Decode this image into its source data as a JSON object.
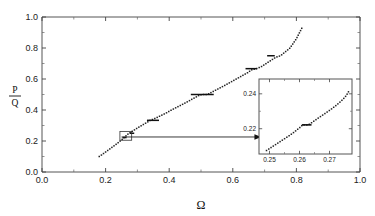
{
  "figure": {
    "background_color": "#ffffff",
    "line_color": "#222222",
    "axis_color": "#444444"
  },
  "chart_data": {
    "type": "line",
    "title": "",
    "subtitle": "",
    "xlabel": "Ω",
    "ylabel_numerator": "P",
    "ylabel_denominator": "Q",
    "ylabel": "P/Q",
    "xlim": [
      0.0,
      1.0
    ],
    "ylim": [
      0.0,
      1.0
    ],
    "grid": false,
    "legend": false,
    "legend_position": "none",
    "xticks": [
      0.0,
      0.2,
      0.4,
      0.6,
      0.8,
      1.0
    ],
    "xticklabels": [
      "0.0",
      "0.2",
      "0.4",
      "0.6",
      "0.8",
      "1.0"
    ],
    "yticks": [
      0.0,
      0.2,
      0.4,
      0.6,
      0.8,
      1.0
    ],
    "yticklabels": [
      "0.0",
      "0.2",
      "0.4",
      "0.6",
      "0.8",
      "1.0"
    ],
    "minor_tick_count_per_interval": 1,
    "x": [
      0.18,
      0.186,
      0.192,
      0.198,
      0.204,
      0.21,
      0.216,
      0.222,
      0.228,
      0.234,
      0.24,
      0.246,
      0.252,
      0.258,
      0.264,
      0.27,
      0.276,
      0.282,
      0.288,
      0.294,
      0.3,
      0.31,
      0.32,
      0.33,
      0.34,
      0.35,
      0.36,
      0.37,
      0.38,
      0.39,
      0.4,
      0.412,
      0.424,
      0.436,
      0.448,
      0.46,
      0.472,
      0.484,
      0.496,
      0.508,
      0.52,
      0.534,
      0.548,
      0.562,
      0.576,
      0.59,
      0.604,
      0.618,
      0.632,
      0.646,
      0.66,
      0.675,
      0.69,
      0.705,
      0.72,
      0.735,
      0.75,
      0.765,
      0.78,
      0.8,
      0.82
    ],
    "y": [
      0.1,
      0.108,
      0.117,
      0.126,
      0.135,
      0.144,
      0.153,
      0.162,
      0.171,
      0.18,
      0.19,
      0.2,
      0.21,
      0.222,
      0.233,
      0.244,
      0.252,
      0.26,
      0.268,
      0.276,
      0.284,
      0.296,
      0.308,
      0.32,
      0.333,
      0.341,
      0.35,
      0.36,
      0.37,
      0.38,
      0.392,
      0.405,
      0.418,
      0.43,
      0.443,
      0.456,
      0.47,
      0.483,
      0.497,
      0.5,
      0.5,
      0.515,
      0.53,
      0.545,
      0.56,
      0.576,
      0.592,
      0.608,
      0.624,
      0.64,
      0.66,
      0.667,
      0.68,
      0.7,
      0.72,
      0.74,
      0.75,
      0.775,
      0.8,
      0.86,
      0.94
    ],
    "plateaus": [
      {
        "ratio": "1/3",
        "y": 0.3333,
        "x_start": 0.33,
        "x_end": 0.368
      },
      {
        "ratio": "1/2",
        "y": 0.5,
        "x_start": 0.468,
        "x_end": 0.54
      },
      {
        "ratio": "2/3",
        "y": 0.6667,
        "x_start": 0.64,
        "x_end": 0.676
      },
      {
        "ratio": "3/4",
        "y": 0.75,
        "x_start": 0.708,
        "x_end": 0.732
      },
      {
        "ratio": "2/9",
        "y": 0.2222,
        "x_start": 0.253,
        "x_end": 0.266
      },
      {
        "ratio": "1/4",
        "y": 0.25,
        "x_start": 0.276,
        "x_end": 0.29
      }
    ],
    "zoom_box": {
      "x_start": 0.245,
      "x_end": 0.282,
      "y_start": 0.205,
      "y_end": 0.262
    },
    "arrow": {
      "from_x": 0.25,
      "from_y": 0.226,
      "to_x": 0.69,
      "to_y": 0.226
    }
  },
  "inset": {
    "type": "line",
    "xlabel": "",
    "ylabel": "",
    "xlim": [
      0.2465,
      0.2775
    ],
    "ylim": [
      0.2055,
      0.2485
    ],
    "grid": false,
    "xticks": [
      0.25,
      0.26,
      0.27
    ],
    "xticklabels": [
      "0.25",
      "0.26",
      "0.27"
    ],
    "yticks": [
      0.22,
      0.24
    ],
    "yticklabels": [
      "0.22",
      "0.24"
    ],
    "x": [
      0.249,
      0.2498,
      0.2506,
      0.2514,
      0.2522,
      0.253,
      0.2538,
      0.2546,
      0.2554,
      0.2562,
      0.257,
      0.2578,
      0.2586,
      0.2594,
      0.2602,
      0.261,
      0.262,
      0.263,
      0.264,
      0.265,
      0.266,
      0.2672,
      0.2684,
      0.2696,
      0.2708,
      0.272,
      0.2732,
      0.2744,
      0.2756,
      0.2766
    ],
    "y": [
      0.2075,
      0.2084,
      0.2093,
      0.2102,
      0.2111,
      0.212,
      0.2129,
      0.2138,
      0.2147,
      0.2156,
      0.2165,
      0.2175,
      0.2186,
      0.2197,
      0.2208,
      0.2222,
      0.2222,
      0.2222,
      0.2234,
      0.2246,
      0.2258,
      0.2272,
      0.2286,
      0.23,
      0.2315,
      0.2331,
      0.2348,
      0.2367,
      0.239,
      0.242
    ],
    "plateaus": [
      {
        "ratio": "2/9",
        "y": 0.2222,
        "x_start": 0.2608,
        "x_end": 0.264
      }
    ]
  }
}
